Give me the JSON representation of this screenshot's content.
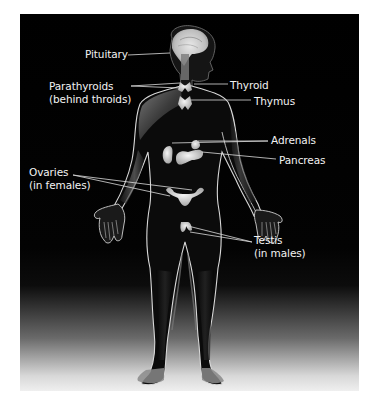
{
  "diagram": {
    "background_color": "#000000",
    "label_color": "#f2f2f2",
    "leader_line_color": "#dcdcdc",
    "labels": {
      "pituitary": {
        "lines": [
          "Pituitary"
        ]
      },
      "parathyroids": {
        "lines": [
          "Parathyroids",
          "(behind throids)"
        ]
      },
      "thyroid": {
        "lines": [
          "Thyroid"
        ]
      },
      "thymus": {
        "lines": [
          "Thymus"
        ]
      },
      "adrenals": {
        "lines": [
          "Adrenals"
        ]
      },
      "pancreas": {
        "lines": [
          "Pancreas"
        ]
      },
      "ovaries": {
        "lines": [
          "Ovaries",
          "(in females)"
        ]
      },
      "testis": {
        "lines": [
          "Testis",
          "(in males)"
        ]
      }
    }
  }
}
